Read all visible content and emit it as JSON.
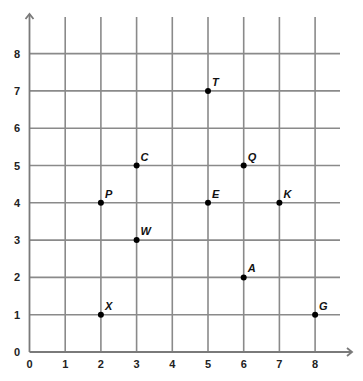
{
  "chart_data": {
    "type": "scatter",
    "title": "",
    "xlabel": "",
    "ylabel": "",
    "xlim": [
      0,
      8
    ],
    "ylim": [
      0,
      8
    ],
    "grid": true,
    "x_ticks": [
      "0",
      "1",
      "2",
      "3",
      "4",
      "5",
      "6",
      "7",
      "8"
    ],
    "y_ticks": [
      "0",
      "1",
      "2",
      "3",
      "4",
      "5",
      "6",
      "7",
      "8"
    ],
    "points": [
      {
        "label": "T",
        "x": 5,
        "y": 7
      },
      {
        "label": "C",
        "x": 3,
        "y": 5
      },
      {
        "label": "Q",
        "x": 6,
        "y": 5
      },
      {
        "label": "P",
        "x": 2,
        "y": 4
      },
      {
        "label": "E",
        "x": 5,
        "y": 4
      },
      {
        "label": "K",
        "x": 7,
        "y": 4
      },
      {
        "label": "W",
        "x": 3,
        "y": 3
      },
      {
        "label": "A",
        "x": 6,
        "y": 2
      },
      {
        "label": "X",
        "x": 2,
        "y": 1
      },
      {
        "label": "G",
        "x": 8,
        "y": 1
      }
    ]
  }
}
